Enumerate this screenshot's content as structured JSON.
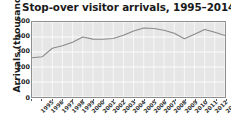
{
  "chart_data": {
    "type": "line",
    "title": "Stop-over visitor arrivals, 1995–2014",
    "xlabel": "",
    "ylabel": "Arrivals (thousands)",
    "ylim": [
      0,
      500
    ],
    "yticks": [
      0,
      100,
      200,
      300,
      400,
      500
    ],
    "ytick_labels": [
      "0",
      "100",
      "200",
      "300",
      "400",
      "500"
    ],
    "grid": true,
    "legend": false,
    "legend_position": "none",
    "line_color": "#8a8a8a",
    "plot_background": "#e6e6e6",
    "gridline_color": "#ffffff",
    "categories": [
      "1995",
      "1996",
      "1997",
      "1998",
      "1999",
      "2000",
      "2001",
      "2002",
      "2003",
      "2004",
      "2005",
      "2006",
      "2007",
      "2008",
      "2009",
      "2010",
      "2011",
      "2012",
      "2013",
      "2014"
    ],
    "x": [
      1995,
      1996,
      1997,
      1998,
      1999,
      2000,
      2001,
      2002,
      2003,
      2004,
      2005,
      2006,
      2007,
      2008,
      2009,
      2010,
      2011,
      2012,
      2013,
      2014
    ],
    "values": [
      262,
      268,
      325,
      342,
      365,
      400,
      386,
      385,
      390,
      412,
      440,
      460,
      457,
      445,
      425,
      388,
      418,
      450,
      432,
      410
    ]
  }
}
